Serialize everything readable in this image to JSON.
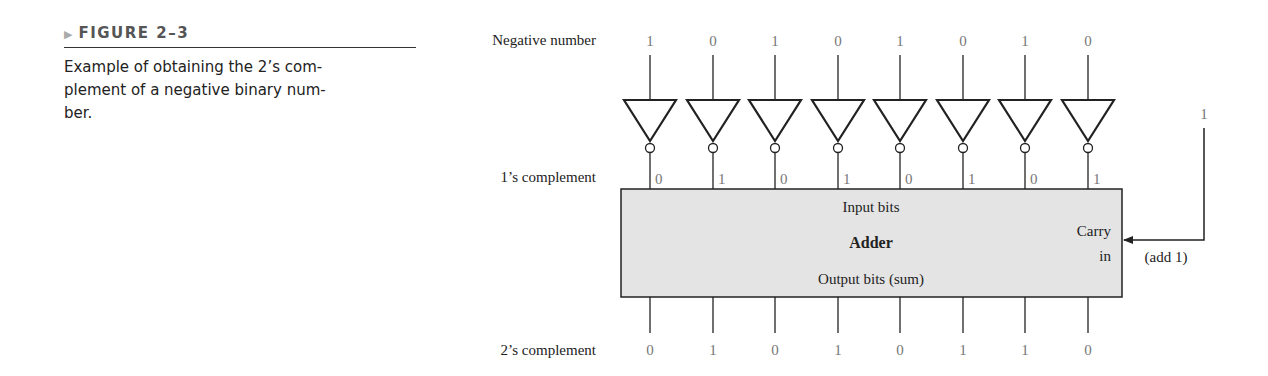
{
  "caption": {
    "figure_label": "FIGURE 2–3",
    "marker_icon": "triangle-right",
    "text_lines": [
      "Example of obtaining the 2’s com-",
      "plement of a negative binary num-",
      "ber."
    ]
  },
  "diagram": {
    "row_labels": {
      "negative": "Negative number",
      "ones": "1’s complement",
      "twos": "2’s complement"
    },
    "negative_bits": [
      "1",
      "0",
      "1",
      "0",
      "1",
      "0",
      "1",
      "0"
    ],
    "ones_complement_bits": [
      "0",
      "1",
      "0",
      "1",
      "0",
      "1",
      "0",
      "1"
    ],
    "twos_complement_bits": [
      "0",
      "1",
      "0",
      "1",
      "0",
      "1",
      "1",
      "0"
    ],
    "adder": {
      "title": "Adder",
      "input_label": "Input bits",
      "output_label": "Output bits (sum)",
      "carry_label_1": "Carry",
      "carry_label_2": "in"
    },
    "carry_input": {
      "value": "1",
      "note": "(add 1)"
    },
    "colors": {
      "box_fill": "#e4e4e4",
      "line": "#222222",
      "bit_text": "#777777"
    }
  }
}
